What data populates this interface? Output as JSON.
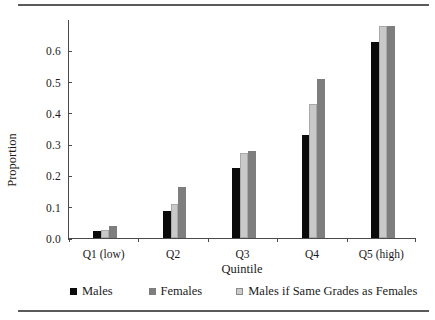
{
  "chart_data": {
    "type": "bar",
    "title": "",
    "xlabel": "Quintile",
    "ylabel": "Proportion",
    "categories": [
      "Q1 (low)",
      "Q2",
      "Q3",
      "Q4",
      "Q5 (high)"
    ],
    "yticks": [
      "0.0",
      "0.1",
      "0.2",
      "0.3",
      "0.4",
      "0.5",
      "0.6"
    ],
    "ylim": [
      0.0,
      0.7
    ],
    "grid": false,
    "legend_position": "bottom",
    "series": [
      {
        "name": "Males",
        "color": "#0b0b0b",
        "values": [
          0.022,
          0.088,
          0.225,
          0.33,
          0.628
        ]
      },
      {
        "name": "Males if Same Grades as Females",
        "color": "#c9c9c9",
        "values": [
          0.027,
          0.108,
          0.274,
          0.429,
          0.682
        ]
      },
      {
        "name": "Females",
        "color": "#7e7e7e",
        "values": [
          0.04,
          0.164,
          0.278,
          0.512,
          0.682
        ]
      }
    ],
    "legend": [
      {
        "label": "Males",
        "swatch": "s-black"
      },
      {
        "label": "Females",
        "swatch": "s-dark"
      },
      {
        "label": "Males if Same Grades as Females",
        "swatch": "s-light"
      }
    ]
  }
}
